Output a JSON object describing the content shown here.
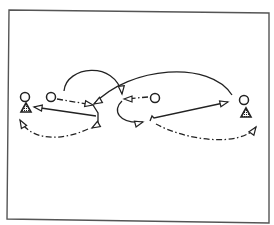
{
  "diagram": {
    "type": "play-diagram",
    "frame": {
      "points": "9,10 269,13 269,223 7,219",
      "stroke": "#555555"
    },
    "colors": {
      "ink": "#222222",
      "background": "#ffffff"
    },
    "players": [
      {
        "id": "offense-left",
        "shape": "circle",
        "x": 25,
        "y": 97
      },
      {
        "id": "defense-left",
        "shape": "triangle",
        "x": 26,
        "y": 108
      },
      {
        "id": "offense-left-2",
        "shape": "circle",
        "x": 51,
        "y": 97
      },
      {
        "id": "offense-center",
        "shape": "circle",
        "x": 155,
        "y": 98
      },
      {
        "id": "offense-right",
        "shape": "circle",
        "x": 244,
        "y": 100
      },
      {
        "id": "defense-right",
        "shape": "triangle",
        "x": 246,
        "y": 113
      }
    ],
    "paths": [
      {
        "id": "pass-left2-to-center",
        "style": "dash-dot",
        "d": "M57,99 L93,105"
      },
      {
        "id": "cut-arc-left",
        "style": "solid",
        "d": "M64,91 C66,66 115,60 122,94"
      },
      {
        "id": "cut-arc-right",
        "style": "solid",
        "d": "M232,95 C210,60 130,66 94,104"
      },
      {
        "id": "pass-center-left",
        "style": "dash-dot",
        "d": "M148,97 L124,99"
      },
      {
        "id": "curl-center",
        "style": "solid",
        "d": "M122,101 C112,110 118,124 143,122"
      },
      {
        "id": "drive-right",
        "style": "solid",
        "d": "M150,121 L152,116 L154,118 L228,102"
      },
      {
        "id": "dashed-curve-right",
        "style": "dash-dot",
        "d": "M156,124 C185,140 240,148 256,127"
      },
      {
        "id": "line-to-left-triangle",
        "style": "solid",
        "d": "M96,116 L34,107"
      },
      {
        "id": "screen-path",
        "style": "solid",
        "d": "M93,105 L98,113 L98,124 L92,128"
      },
      {
        "id": "dashed-curve-left",
        "style": "dash-dot",
        "d": "M88,129 C60,142 30,140 20,120"
      }
    ],
    "arrowheads": [
      {
        "at": "93,105",
        "angle": 10
      },
      {
        "at": "122,94",
        "angle": 85
      },
      {
        "at": "94,104",
        "angle": 150
      },
      {
        "at": "124,99",
        "angle": 180
      },
      {
        "at": "143,122",
        "angle": -15
      },
      {
        "at": "228,102",
        "angle": -13
      },
      {
        "at": "256,127",
        "angle": -55
      },
      {
        "at": "34,107",
        "angle": 188
      },
      {
        "at": "92,128",
        "angle": 150
      },
      {
        "at": "20,120",
        "angle": 240
      }
    ]
  }
}
